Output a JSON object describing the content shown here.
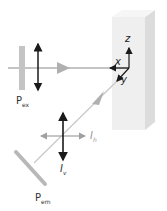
{
  "diagram": {
    "type": "fluorescence polarization setup",
    "sample": "sample-block",
    "axes": {
      "x": "x",
      "y": "y",
      "z": "z"
    },
    "labels": {
      "excitation_polarizer": {
        "main": "P",
        "sub": "ex"
      },
      "emission_polarizer": {
        "main": "P",
        "sub": "em"
      },
      "vertical_intensity": {
        "main": "I",
        "sub": "v"
      },
      "horizontal_intensity": {
        "main": "I",
        "sub": "h"
      }
    },
    "colors": {
      "beam": "#b0b0b0",
      "polarizer": "#b8b8b8",
      "arrow_dark": "#1a1a1a",
      "block_front": "#efefef",
      "block_side": "#dcdcdc"
    }
  }
}
